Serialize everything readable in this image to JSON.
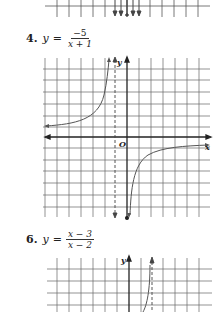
{
  "problems": [
    {
      "number": "4.",
      "lhs": "y",
      "equals": "=",
      "numerator": "−5",
      "denominator": "x + 1",
      "graph": {
        "x_axis_label": "x",
        "y_axis_label": "y",
        "origin_label": "O",
        "vertical_asymptote": "x = -1",
        "horizontal_asymptote": "y = 0"
      }
    },
    {
      "number": "6.",
      "lhs": "y",
      "equals": "=",
      "numerator": "x − 3",
      "denominator": "x − 2",
      "graph": {
        "y_axis_label": "y",
        "vertical_asymptote": "x = 2"
      }
    }
  ]
}
